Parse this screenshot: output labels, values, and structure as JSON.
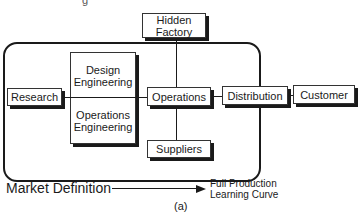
{
  "figure": {
    "cut_off_text": "g",
    "caption": "(a)",
    "nodes": {
      "hidden_factory": {
        "line1": "Hidden",
        "line2": "Factory"
      },
      "research": "Research",
      "design_engineering": {
        "line1": "Design",
        "line2": "Engineering"
      },
      "operations_engineering": {
        "line1": "Operations",
        "line2": "Engineering"
      },
      "operations": "Operations",
      "suppliers": "Suppliers",
      "distribution": "Distribution",
      "customer": "Customer"
    },
    "timeline": {
      "start_label": "Market Definition",
      "end_label_line1": "Full Production",
      "end_label_line2": "Learning Curve"
    }
  }
}
